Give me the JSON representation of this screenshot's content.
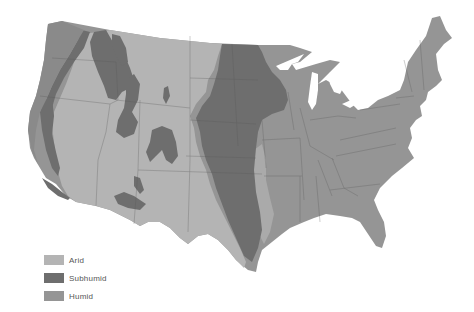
{
  "map": {
    "title": "",
    "region": "Contiguous United States",
    "zones": [
      {
        "id": "arid",
        "label": "Arid",
        "color": "#b4b4b4"
      },
      {
        "id": "subhumid",
        "label": "Subhumid",
        "color": "#6e6e6e"
      },
      {
        "id": "humid",
        "label": "Humid",
        "color": "#959595"
      }
    ]
  },
  "legend": {
    "items": [
      {
        "label": "Arid",
        "color": "#b4b4b4"
      },
      {
        "label": "Subhumid",
        "color": "#6e6e6e"
      },
      {
        "label": "Humid",
        "color": "#959595"
      }
    ]
  }
}
